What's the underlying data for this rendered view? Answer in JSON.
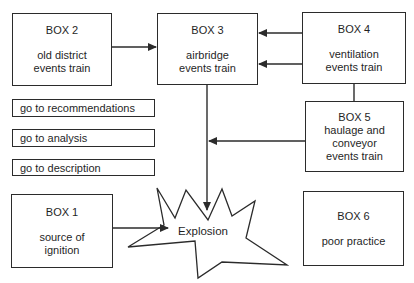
{
  "diagram": {
    "boxes": {
      "box2": {
        "title": "BOX 2",
        "body": "old district\nevents train"
      },
      "box3": {
        "title": "BOX 3",
        "body": "airbridge\nevents train"
      },
      "box4": {
        "title": "BOX 4",
        "body": "ventilation\nevents train"
      },
      "box5": {
        "title": "BOX 5",
        "body": "haulage and\nconveyor\nevents train"
      },
      "box1": {
        "title": "BOX 1",
        "body": "source of\nignition"
      },
      "box6": {
        "title": "BOX 6",
        "body": "poor practice"
      }
    },
    "links": {
      "recommendations": "go to recommendations",
      "analysis": "go to analysis",
      "description": "go to description"
    },
    "explosion_label": "Explosion",
    "colors": {
      "line": "#2b2b2b",
      "background": "#ffffff",
      "text": "#1f1f1f"
    }
  }
}
